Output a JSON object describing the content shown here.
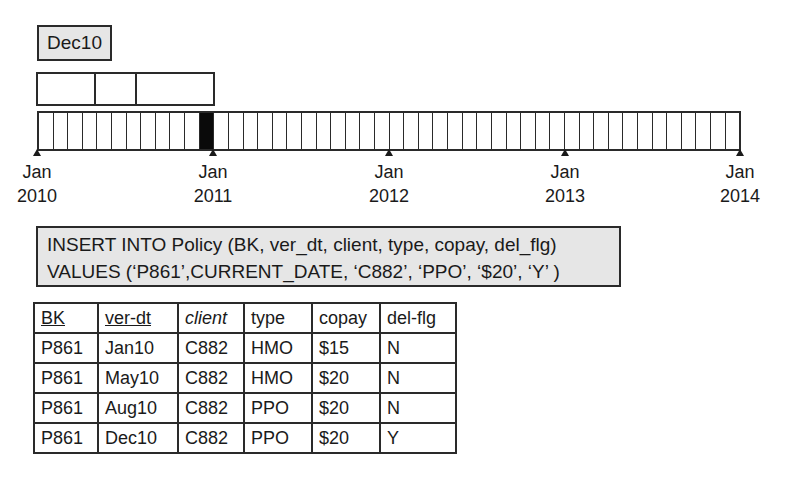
{
  "current_version_label": "Dec10",
  "version_segments": [
    {
      "label": "Jan10-May10",
      "width_px": 58
    },
    {
      "label": "May10-Aug10",
      "width_px": 41
    },
    {
      "label": "Aug10-Dec10",
      "width_px": 80
    }
  ],
  "timeline": {
    "months": 48,
    "filled_month_index": 11,
    "ticks": [
      {
        "month": "Jan",
        "year": "2010",
        "x": 37
      },
      {
        "month": "Jan",
        "year": "2011",
        "x": 213
      },
      {
        "month": "Jan",
        "year": "2012",
        "x": 389
      },
      {
        "month": "Jan",
        "year": "2013",
        "x": 565
      },
      {
        "month": "Jan",
        "year": "2014",
        "x": 740
      }
    ]
  },
  "sql": {
    "line1": "INSERT INTO Policy (BK, ver_dt, client, type, copay, del_flg)",
    "line2": "VALUES (‘P861’,CURRENT_DATE, ‘C882’, ‘PPO’, ‘$20’, ‘Y’ )"
  },
  "table": {
    "headers": [
      {
        "label": "BK",
        "style": "underline"
      },
      {
        "label": "ver-dt",
        "style": "underline"
      },
      {
        "label": "client",
        "style": "italic"
      },
      {
        "label": "type",
        "style": "normal"
      },
      {
        "label": "copay",
        "style": "normal"
      },
      {
        "label": "del-flg",
        "style": "normal"
      }
    ],
    "rows": [
      [
        "P861",
        "Jan10",
        "C882",
        "HMO",
        "$15",
        "N"
      ],
      [
        "P861",
        "May10",
        "C882",
        "HMO",
        "$20",
        "N"
      ],
      [
        "P861",
        "Aug10",
        "C882",
        "PPO",
        "$20",
        "N"
      ],
      [
        "P861",
        "Dec10",
        "C882",
        "PPO",
        "$20",
        "Y"
      ]
    ]
  },
  "colors": {
    "box_fill": "#e6e6e6",
    "line": "#2a2a2a",
    "filled_cell": "#0a0a0a"
  }
}
